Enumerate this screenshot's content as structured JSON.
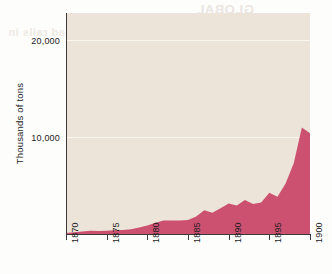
{
  "chart_data": {
    "type": "area",
    "title": "",
    "subtitle": "",
    "xlabel": "",
    "ylabel": "Thousands of tons",
    "xlim": [
      1870,
      1900
    ],
    "ylim": [
      0,
      22800
    ],
    "grid": true,
    "legend": null,
    "series_color": "#cc5070",
    "plot_background": "#ece4d8",
    "page_background": "#fdfdfc",
    "gridline_color": "#f9f5ef",
    "axis_color": "#3a3a3a",
    "y_ticks": [
      {
        "value": 10000,
        "label": "10,000"
      },
      {
        "value": 20000,
        "label": "20,000"
      }
    ],
    "x_ticks": [
      {
        "value": 1870,
        "label": "1870"
      },
      {
        "value": 1875,
        "label": "1875"
      },
      {
        "value": 1880,
        "label": "1880"
      },
      {
        "value": 1885,
        "label": "1885"
      },
      {
        "value": 1890,
        "label": "1890"
      },
      {
        "value": 1895,
        "label": "1895"
      },
      {
        "value": 1900,
        "label": "1900"
      }
    ],
    "x": [
      1870,
      1871,
      1872,
      1873,
      1874,
      1875,
      1876,
      1877,
      1878,
      1879,
      1880,
      1881,
      1882,
      1883,
      1884,
      1885,
      1886,
      1887,
      1888,
      1889,
      1890,
      1891,
      1892,
      1893,
      1894,
      1895,
      1896,
      1897,
      1898,
      1899,
      1900
    ],
    "series": [
      {
        "name": "Thousands of tons",
        "values": [
          100,
          170,
          260,
          330,
          320,
          330,
          380,
          420,
          500,
          660,
          880,
          1150,
          1380,
          1400,
          1400,
          1450,
          1800,
          2450,
          2200,
          2650,
          3150,
          2950,
          3500,
          3100,
          3250,
          4250,
          3850,
          5200,
          7300,
          11000,
          10400
        ]
      }
    ]
  },
  "axis_titles": {
    "y": "Thousands of tons"
  },
  "bleed_through": {
    "line1": "GLOBAL",
    "line2": "SUPREMACY",
    "line3": "Railroad rails in"
  }
}
